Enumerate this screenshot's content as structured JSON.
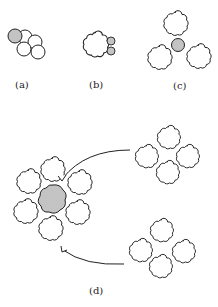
{
  "figure": {
    "panels": [
      {
        "id": "a",
        "label": "(a)",
        "description": "shaded particle attached to cluster of four plain spheres"
      },
      {
        "id": "b",
        "label": "(b)",
        "description": "large lobed particle with two small shaded particles"
      },
      {
        "id": "c",
        "label": "(c)",
        "description": "small shaded particle surrounded by three lobed particles"
      },
      {
        "id": "d",
        "label": "(d)",
        "description": "shaded core surrounded by six lobed particles; two four-lobed clusters with arrows pointing toward it"
      }
    ],
    "colors": {
      "stroke": "#222222",
      "shade": "#9a9a9a",
      "background": "#ffffff"
    }
  }
}
